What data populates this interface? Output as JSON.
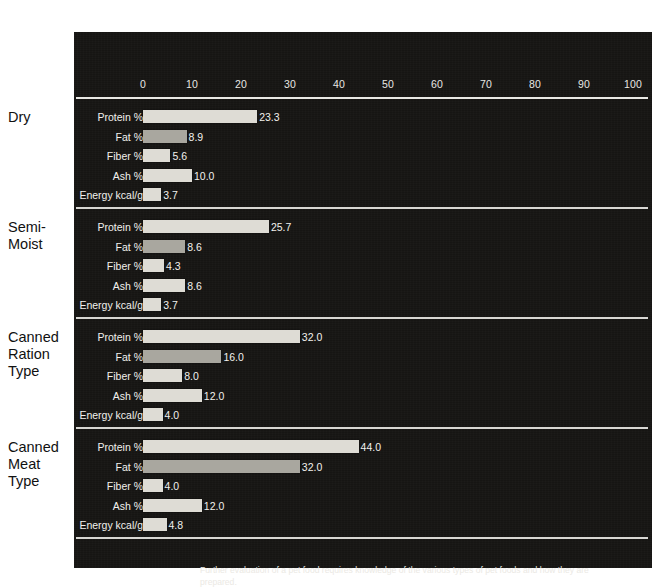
{
  "chart_data": {
    "type": "bar",
    "orientation": "horizontal",
    "title": "",
    "xlabel": "",
    "ylabel": "",
    "xlim": [
      0,
      100
    ],
    "xticks": [
      0,
      10,
      20,
      30,
      40,
      50,
      60,
      70,
      80,
      90,
      100
    ],
    "grid": false,
    "legend": null,
    "measures": [
      "Protein %",
      "Fat %",
      "Fiber %",
      "Ash %",
      "Energy kcal/g"
    ],
    "groups": [
      {
        "name": "Dry",
        "label_lines": [
          "Dry"
        ],
        "rows": [
          {
            "label": "Protein %",
            "value": 23.3,
            "display": "23.3",
            "shade": "light"
          },
          {
            "label": "Fat %",
            "value": 8.9,
            "display": "8.9",
            "shade": "dark"
          },
          {
            "label": "Fiber %",
            "value": 5.6,
            "display": "5.6",
            "shade": "light"
          },
          {
            "label": "Ash %",
            "value": 10.0,
            "display": "10.0",
            "shade": "light"
          },
          {
            "label": "Energy kcal/g",
            "value": 3.7,
            "display": "3.7",
            "shade": "light"
          }
        ]
      },
      {
        "name": "Semi-Moist",
        "label_lines": [
          "Semi-",
          "Moist"
        ],
        "rows": [
          {
            "label": "Protein %",
            "value": 25.7,
            "display": "25.7",
            "shade": "light"
          },
          {
            "label": "Fat %",
            "value": 8.6,
            "display": "8.6",
            "shade": "dark"
          },
          {
            "label": "Fiber %",
            "value": 4.3,
            "display": "4.3",
            "shade": "light"
          },
          {
            "label": "Ash %",
            "value": 8.6,
            "display": "8.6",
            "shade": "light"
          },
          {
            "label": "Energy kcal/g",
            "value": 3.7,
            "display": "3.7",
            "shade": "light"
          }
        ]
      },
      {
        "name": "Canned Ration Type",
        "label_lines": [
          "Canned",
          "Ration",
          "Type"
        ],
        "rows": [
          {
            "label": "Protein %",
            "value": 32.0,
            "display": "32.0",
            "shade": "light"
          },
          {
            "label": "Fat %",
            "value": 16.0,
            "display": "16.0",
            "shade": "dark"
          },
          {
            "label": "Fiber %",
            "value": 8.0,
            "display": "8.0",
            "shade": "light"
          },
          {
            "label": "Ash %",
            "value": 12.0,
            "display": "12.0",
            "shade": "light"
          },
          {
            "label": "Energy kcal/g",
            "value": 4.0,
            "display": "4.0",
            "shade": "light"
          }
        ]
      },
      {
        "name": "Canned Meat Type",
        "label_lines": [
          "Canned",
          "Meat",
          "Type"
        ],
        "rows": [
          {
            "label": "Protein %",
            "value": 44.0,
            "display": "44.0",
            "shade": "light"
          },
          {
            "label": "Fat %",
            "value": 32.0,
            "display": "32.0",
            "shade": "dark"
          },
          {
            "label": "Fiber %",
            "value": 4.0,
            "display": "4.0",
            "shade": "light"
          },
          {
            "label": "Ash %",
            "value": 12.0,
            "display": "12.0",
            "shade": "light"
          },
          {
            "label": "Energy kcal/g",
            "value": 4.8,
            "display": "4.8",
            "shade": "light"
          }
        ]
      }
    ],
    "caption": "Further evaluation of a pet food requires knowledge of the various types of pet foods and how they are prepared."
  },
  "colors": {
    "panel_background": "#161513",
    "bar_light": "#dedcd5",
    "bar_dark": "#a9a79f",
    "rule": "#e9e8e4",
    "text_on_dark": "#f2f1ed",
    "text_on_light": "#111111"
  }
}
